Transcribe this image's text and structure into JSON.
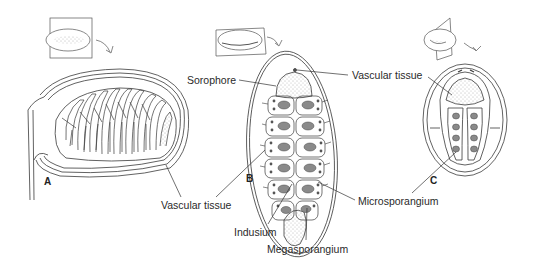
{
  "figure": {
    "panels": [
      {
        "id": "A",
        "letter": "A",
        "description": "Longitudinal section of sporocarp"
      },
      {
        "id": "B",
        "letter": "B",
        "description": "Horizontal section of sporocarp"
      },
      {
        "id": "C",
        "letter": "C",
        "description": "Transverse section of sporocarp"
      }
    ],
    "labels": {
      "sorophore": "Sorophore",
      "vascular_tissue_top": "Vascular tissue",
      "vascular_tissue_bottom": "Vascular tissue",
      "indusium": "Indusium",
      "megasporangium": "Megasporangium",
      "microsporangium": "Microsporangium"
    },
    "colors": {
      "line": "#3a3a3a",
      "stipple": "#777777",
      "sporangium_fill": "#8a8a8a",
      "background": "#ffffff"
    }
  }
}
